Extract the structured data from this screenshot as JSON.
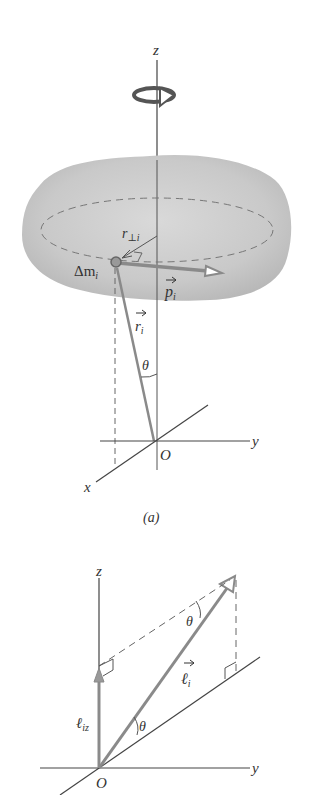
{
  "figure_a": {
    "caption": "(a)",
    "labels": {
      "z_axis": "z",
      "y_axis": "y",
      "x_axis": "x",
      "origin": "O",
      "mass_element": "Δm",
      "mass_sub": "i",
      "r_perp": "r",
      "r_perp_sub": "⊥i",
      "momentum": "p",
      "momentum_sub": "i",
      "position": "r",
      "position_sub": "i",
      "angle": "θ"
    },
    "icons": [
      "rotation-arrow-icon"
    ]
  },
  "figure_b": {
    "labels": {
      "z_axis": "z",
      "y_axis": "y",
      "origin": "O",
      "angular_momentum": "ℓ",
      "angular_momentum_sub": "i",
      "z_component": "ℓ",
      "z_component_sub": "iz",
      "angle_top": "θ",
      "angle_bottom": "θ"
    }
  },
  "colors": {
    "body_fill": "#c8c8c8",
    "vector_gray": "#8a8a8a",
    "axis": "#444444",
    "text": "#333333"
  }
}
